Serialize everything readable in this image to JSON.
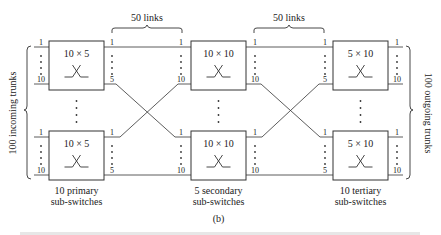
{
  "figure": {
    "subfigure_label": "(b)",
    "caption_partial": "",
    "stroke_color": "#333333",
    "background": "#ffffff"
  },
  "brackets": {
    "left_incoming": "100 incoming trunks",
    "right_outgoing": "100 outgoing trunks",
    "links_left": "50 links",
    "links_right": "50 links"
  },
  "stages": [
    {
      "name": "primary",
      "switch_label": "10 × 5",
      "inputs_first": "1",
      "inputs_last": "10",
      "outputs_first": "1",
      "outputs_last": "5",
      "caption_line1": "10 primary",
      "caption_line2": "sub-switches"
    },
    {
      "name": "secondary",
      "switch_label": "10 × 10",
      "inputs_first": "1",
      "inputs_last": "10",
      "outputs_first": "1",
      "outputs_last": "10",
      "caption_line1": "5 secondary",
      "caption_line2": "sub-switches"
    },
    {
      "name": "tertiary",
      "switch_label": "5 × 10",
      "inputs_first": "1",
      "inputs_last": "5",
      "outputs_first": "1",
      "outputs_last": "10",
      "caption_line1": "10 tertiary",
      "caption_line2": "sub-switches"
    }
  ]
}
